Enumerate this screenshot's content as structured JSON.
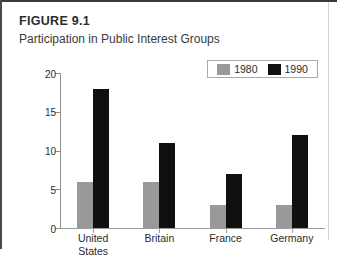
{
  "figure": {
    "number": "FIGURE 9.1",
    "title": "Participation in Public Interest Groups"
  },
  "colors": {
    "series_1980": "#999999",
    "series_1990": "#101010",
    "axis": "#8e8e8e",
    "text": "#2b2b2b",
    "rule": "#3a3a3a"
  },
  "chart_data": {
    "type": "bar",
    "title": "Participation in Public Interest Groups",
    "xlabel": "",
    "ylabel": "Membership percentage",
    "categories": [
      "United States",
      "Britain",
      "France",
      "Germany"
    ],
    "category_lines": [
      [
        "United",
        "States"
      ],
      [
        "Britain"
      ],
      [
        "France"
      ],
      [
        "Germany"
      ]
    ],
    "series": [
      {
        "name": "1980",
        "color": "#999999",
        "values": [
          6,
          6,
          3,
          3
        ]
      },
      {
        "name": "1990",
        "color": "#101010",
        "values": [
          18,
          11,
          7,
          12
        ]
      }
    ],
    "ylim": [
      0,
      20
    ],
    "yticks": [
      0,
      5,
      10,
      15,
      20
    ],
    "ytick_labels": [
      "0",
      "5",
      "10",
      "15",
      "20"
    ],
    "grid": false,
    "legend_position": "top-right"
  }
}
